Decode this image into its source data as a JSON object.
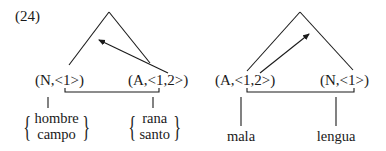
{
  "example_number": "(24)",
  "trees": [
    {
      "id": "left",
      "left_node": "(N,<1>)",
      "right_node": "(A,<1,2>)",
      "arrow_direction": "right-to-left",
      "left_words": [
        "hombre",
        "campo"
      ],
      "right_words": [
        "rana",
        "santo"
      ]
    },
    {
      "id": "right",
      "left_node": "(A,<1,2>)",
      "right_node": "(N,<1>)",
      "arrow_direction": "left-to-right",
      "left_words": [
        "mala"
      ],
      "right_words": [
        "lengua"
      ]
    }
  ],
  "colors": {
    "ink": "#1a1a1a",
    "background": "#ffffff"
  }
}
